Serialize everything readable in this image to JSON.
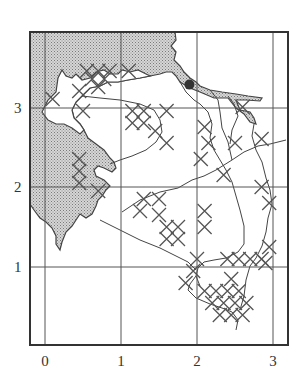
{
  "figure": {
    "type": "grid-referenced outline map",
    "colors": {
      "frame": "#333333",
      "grid": "#555555",
      "coast": "#444444",
      "sea_fill": "#bdbdbd",
      "land_fill": "#ffffff",
      "marker": "#555555",
      "point": "#333333"
    }
  },
  "axes": {
    "x_ticks": [
      {
        "label": "0",
        "px": 45
      },
      {
        "label": "1",
        "px": 121
      },
      {
        "label": "2",
        "px": 197
      },
      {
        "label": "3",
        "px": 273
      }
    ],
    "y_ticks": [
      {
        "label": "3",
        "py": 108
      },
      {
        "label": "2",
        "py": 187
      },
      {
        "label": "1",
        "py": 267
      }
    ]
  },
  "legend_items": {
    "shaded_area": "sea (stippled)",
    "cross_marker": "occurrence record (×)",
    "filled_circle": "reference locality"
  },
  "point_marker": {
    "x": 1.9,
    "y": 3.28
  },
  "cross_markers": [
    [
      0.55,
      3.45
    ],
    [
      0.7,
      3.45
    ],
    [
      0.85,
      3.45
    ],
    [
      0.62,
      3.35
    ],
    [
      0.78,
      3.35
    ],
    [
      0.7,
      3.25
    ],
    [
      1.1,
      3.45
    ],
    [
      0.1,
      3.1
    ],
    [
      0.45,
      3.2
    ],
    [
      0.5,
      2.95
    ],
    [
      1.15,
      2.95
    ],
    [
      1.3,
      2.95
    ],
    [
      1.15,
      2.8
    ],
    [
      1.3,
      2.8
    ],
    [
      1.45,
      2.7
    ],
    [
      1.6,
      2.95
    ],
    [
      1.6,
      2.55
    ],
    [
      0.45,
      2.35
    ],
    [
      0.45,
      2.2
    ],
    [
      0.45,
      2.05
    ],
    [
      0.7,
      1.95
    ],
    [
      1.3,
      1.85
    ],
    [
      1.25,
      1.7
    ],
    [
      1.5,
      1.85
    ],
    [
      1.5,
      1.65
    ],
    [
      1.6,
      1.5
    ],
    [
      1.75,
      1.5
    ],
    [
      1.6,
      1.35
    ],
    [
      1.75,
      1.35
    ],
    [
      2.1,
      1.5
    ],
    [
      2.1,
      1.7
    ],
    [
      2.1,
      2.75
    ],
    [
      2.15,
      2.55
    ],
    [
      2.5,
      2.55
    ],
    [
      2.85,
      2.6
    ],
    [
      2.6,
      3.0
    ],
    [
      2.05,
      2.35
    ],
    [
      2.35,
      2.15
    ],
    [
      2.85,
      2.0
    ],
    [
      2.95,
      1.8
    ],
    [
      1.95,
      0.95
    ],
    [
      1.85,
      0.8
    ],
    [
      2.1,
      0.7
    ],
    [
      2.25,
      0.7
    ],
    [
      2.4,
      0.7
    ],
    [
      2.55,
      0.7
    ],
    [
      2.2,
      0.55
    ],
    [
      2.35,
      0.55
    ],
    [
      2.5,
      0.55
    ],
    [
      2.65,
      0.55
    ],
    [
      2.3,
      0.4
    ],
    [
      2.45,
      0.4
    ],
    [
      2.6,
      0.4
    ],
    [
      2.45,
      0.85
    ],
    [
      2.4,
      1.1
    ],
    [
      2.55,
      1.1
    ],
    [
      2.7,
      1.1
    ],
    [
      2.85,
      1.1
    ],
    [
      2.95,
      1.25
    ],
    [
      2.9,
      1.05
    ],
    [
      2.0,
      1.1
    ]
  ]
}
